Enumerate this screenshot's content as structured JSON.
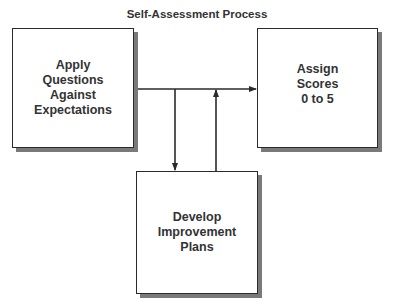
{
  "diagram": {
    "title": "Self-Assessment Process",
    "nodes": [
      {
        "id": "apply",
        "label": "Apply\nQuestions\nAgainst\nExpectations"
      },
      {
        "id": "assign",
        "label": "Assign\nScores\n0 to 5"
      },
      {
        "id": "develop",
        "label": "Develop\nImprovement\nPlans"
      }
    ],
    "edges": [
      {
        "from": "apply",
        "to": "assign",
        "direction": "right"
      },
      {
        "from": "apply",
        "to": "develop",
        "direction": "down"
      },
      {
        "from": "develop",
        "to": "assign",
        "direction": "up"
      }
    ],
    "colors": {
      "border": "#2a2a2a",
      "shadow": "#7a7a7a",
      "text": "#333333",
      "background": "#ffffff"
    }
  }
}
